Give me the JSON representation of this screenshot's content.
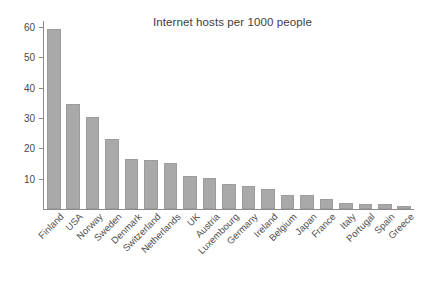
{
  "chart_data": {
    "type": "bar",
    "title": "Internet hosts per 1000 people",
    "xlabel": "",
    "ylabel": "",
    "ylim": [
      0,
      62
    ],
    "grid": false,
    "legend": null,
    "orientation": "vertical",
    "bar_color": "#a9a9a9",
    "axis_color": "#8c8c8c",
    "yticks": [
      10,
      20,
      30,
      40,
      50,
      60
    ],
    "ytick_labels": [
      "10",
      "20",
      "30",
      "40",
      "50",
      "60"
    ],
    "categories": [
      "Finland",
      "USA",
      "Norway",
      "Sweden",
      "Denmark",
      "Switzerland",
      "Netherlands",
      "UK",
      "Austria",
      "Luxembourg",
      "Germany",
      "Ireland",
      "Belgium",
      "Japan",
      "France",
      "Italy",
      "Portugal",
      "Spain",
      "Greece"
    ],
    "values": [
      59.5,
      34.5,
      30.4,
      23.2,
      16.4,
      16.3,
      15.1,
      11.0,
      10.2,
      8.3,
      7.5,
      6.6,
      4.6,
      4.5,
      3.4,
      2.0,
      1.6,
      1.6,
      1.1
    ]
  }
}
